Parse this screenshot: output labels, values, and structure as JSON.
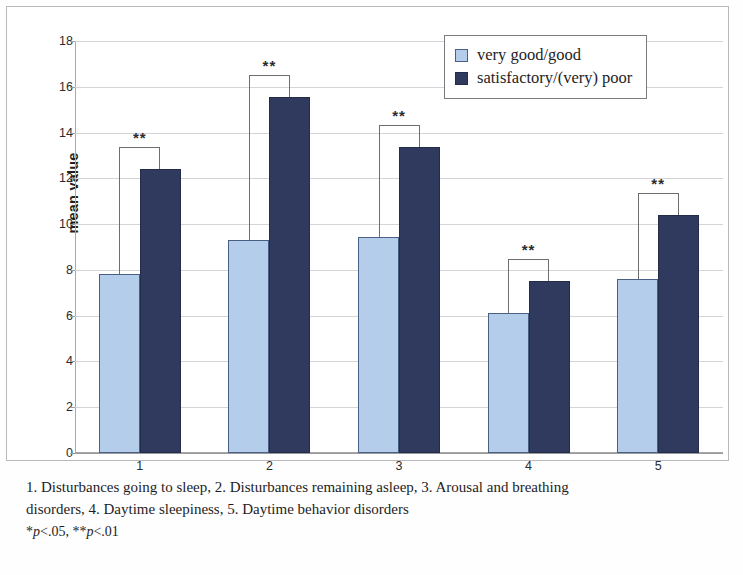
{
  "chart_data": {
    "type": "bar",
    "title": "",
    "xlabel": "",
    "ylabel": "mean value",
    "ylim": [
      0,
      18
    ],
    "ytick_step": 2,
    "yticks": [
      18,
      16,
      14,
      12,
      10,
      8,
      6,
      4,
      2,
      0
    ],
    "categories": [
      "1",
      "2",
      "3",
      "4",
      "5"
    ],
    "grid": true,
    "legend_position": "top-right",
    "series": [
      {
        "name": "very good/good",
        "color": "#b4cdea",
        "values": [
          7.8,
          9.3,
          9.45,
          6.1,
          7.6
        ]
      },
      {
        "name": "satisfactory/(very) poor",
        "color": "#2f3a5e",
        "values": [
          12.4,
          15.55,
          13.35,
          7.5,
          10.4
        ]
      }
    ],
    "annotations": [
      {
        "group": "1",
        "text": "**"
      },
      {
        "group": "2",
        "text": "**"
      },
      {
        "group": "3",
        "text": "**"
      },
      {
        "group": "4",
        "text": "**"
      },
      {
        "group": "5",
        "text": "**"
      }
    ]
  },
  "legend": {
    "items": [
      {
        "label": "very good/good",
        "swatch": "light"
      },
      {
        "label": "satisfactory/(very) poor",
        "swatch": "dark"
      }
    ]
  },
  "caption": {
    "line1": "1. Disturbances going  to sleep,  2. Disturbances remaining asleep,  3. Arousal and breathing",
    "line2": "disorders,  4. Daytime sleepiness,  5. Daytime behavior disorders",
    "pnote_star": "*",
    "pnote_p1": "p",
    "pnote_v1": "<.05, ",
    "pnote_star2": "**",
    "pnote_p2": "p",
    "pnote_v2": "<.01"
  },
  "colors": {
    "series_light": "#b4cdea",
    "series_dark": "#2f3a5e",
    "grid": "#d4d4d8",
    "axis": "#9b9b9e"
  }
}
